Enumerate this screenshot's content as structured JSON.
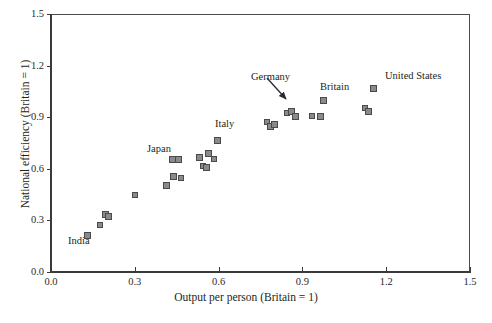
{
  "chart_data": {
    "type": "scatter",
    "title": "",
    "xlabel": "Output per person (Britain = 1)",
    "ylabel": "National efficiency (Britain = 1)",
    "xlim": [
      0.0,
      1.5
    ],
    "ylim": [
      0.0,
      1.5
    ],
    "xticks": [
      "0.0",
      "0.3",
      "0.6",
      "0.9",
      "1.2",
      "1.5"
    ],
    "xtick_values": [
      0.0,
      0.3,
      0.6,
      0.9,
      1.2,
      1.5
    ],
    "yticks": [
      "0.0",
      "0.3",
      "0.6",
      "0.9",
      "1.2",
      "1.5"
    ],
    "ytick_values": [
      0.0,
      0.3,
      0.6,
      0.9,
      1.2,
      1.5
    ],
    "grid": false,
    "legend": "none",
    "marker": "square",
    "marker_fill": "#8a8a8a",
    "marker_edge": "#4a4a4a",
    "points": [
      {
        "x": 0.13,
        "y": 0.21,
        "label": "India"
      },
      {
        "x": 0.175,
        "y": 0.275,
        "label": ""
      },
      {
        "x": 0.195,
        "y": 0.335,
        "label": ""
      },
      {
        "x": 0.205,
        "y": 0.325,
        "label": ""
      },
      {
        "x": 0.3,
        "y": 0.45,
        "label": ""
      },
      {
        "x": 0.415,
        "y": 0.505,
        "label": ""
      },
      {
        "x": 0.44,
        "y": 0.555,
        "label": ""
      },
      {
        "x": 0.465,
        "y": 0.545,
        "label": ""
      },
      {
        "x": 0.435,
        "y": 0.655,
        "label": "Japan"
      },
      {
        "x": 0.455,
        "y": 0.655,
        "label": ""
      },
      {
        "x": 0.545,
        "y": 0.615,
        "label": ""
      },
      {
        "x": 0.53,
        "y": 0.665,
        "label": ""
      },
      {
        "x": 0.565,
        "y": 0.69,
        "label": ""
      },
      {
        "x": 0.585,
        "y": 0.655,
        "label": ""
      },
      {
        "x": 0.595,
        "y": 0.765,
        "label": "Italy"
      },
      {
        "x": 0.555,
        "y": 0.605,
        "label": ""
      },
      {
        "x": 0.775,
        "y": 0.875,
        "label": ""
      },
      {
        "x": 0.785,
        "y": 0.845,
        "label": ""
      },
      {
        "x": 0.8,
        "y": 0.855,
        "label": ""
      },
      {
        "x": 0.845,
        "y": 0.925,
        "label": ""
      },
      {
        "x": 0.86,
        "y": 0.935,
        "label": "Germany"
      },
      {
        "x": 0.875,
        "y": 0.905,
        "label": ""
      },
      {
        "x": 0.935,
        "y": 0.905,
        "label": ""
      },
      {
        "x": 0.965,
        "y": 0.905,
        "label": ""
      },
      {
        "x": 0.975,
        "y": 1.0,
        "label": "Britain"
      },
      {
        "x": 1.125,
        "y": 0.955,
        "label": ""
      },
      {
        "x": 1.135,
        "y": 0.935,
        "label": ""
      },
      {
        "x": 1.155,
        "y": 1.065,
        "label": "United States"
      }
    ],
    "annotations": [
      {
        "name": "india-label",
        "text": "India",
        "x_px": 68,
        "y_px": 235
      },
      {
        "name": "japan-label",
        "text": "Japan",
        "x_px": 147,
        "y_px": 143
      },
      {
        "name": "italy-label",
        "text": "Italy",
        "x_px": 215,
        "y_px": 118
      },
      {
        "name": "germany-label",
        "text": "Germany",
        "x_px": 251,
        "y_px": 71
      },
      {
        "name": "britain-label",
        "text": "Britain",
        "x_px": 320,
        "y_px": 81
      },
      {
        "name": "united-states-label",
        "text": "United States",
        "x_px": 385,
        "y_px": 70
      }
    ],
    "arrow": {
      "name": "germany-pointer",
      "from": [
        268,
        79
      ],
      "to": [
        288,
        102
      ]
    }
  }
}
